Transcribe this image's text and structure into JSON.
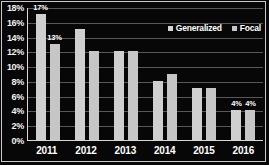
{
  "chart_data": {
    "type": "bar",
    "title": "",
    "xlabel": "",
    "ylabel": "",
    "categories": [
      "2011",
      "2012",
      "2013",
      "2014",
      "2015",
      "2016"
    ],
    "series": [
      {
        "name": "Generalized",
        "values": [
          17,
          15,
          12,
          8,
          7,
          4
        ],
        "labels": [
          "17%",
          "",
          "",
          "",
          "",
          "4%"
        ]
      },
      {
        "name": "Focal",
        "values": [
          13,
          12,
          12,
          9,
          7,
          4
        ],
        "labels": [
          "13%",
          "",
          "",
          "",
          "",
          "4%"
        ]
      }
    ],
    "ylim": [
      0,
      18
    ],
    "ytick_values": [
      18,
      16,
      14,
      12,
      10,
      8,
      6,
      4,
      2,
      0
    ],
    "ytick_labels": [
      "18%",
      "16%",
      "14%",
      "12%",
      "10%",
      "8%",
      "6%",
      "4%",
      "2%",
      "0%"
    ],
    "grid": true,
    "legend_position": "top-right",
    "colors": {
      "background": "#070707",
      "generalized": "#cfcfcf",
      "focal": "#c6c6c6",
      "text": "#ffffff",
      "gridline": "#585858",
      "axis": "#d8d8d8"
    }
  }
}
